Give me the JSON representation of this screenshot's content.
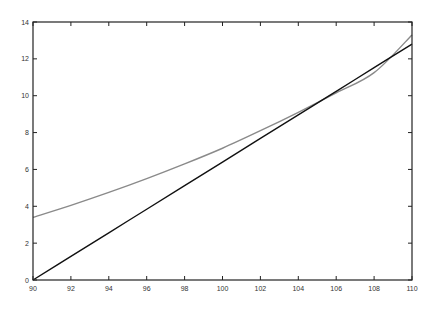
{
  "chart_data": {
    "type": "line",
    "title": "",
    "xlabel": "",
    "ylabel": "",
    "xlim": [
      90,
      110
    ],
    "ylim": [
      0,
      14
    ],
    "grid": false,
    "legend": null,
    "x_ticks": [
      90,
      92,
      94,
      96,
      98,
      100,
      102,
      104,
      106,
      108,
      110
    ],
    "y_ticks": [
      0,
      2,
      4,
      6,
      8,
      10,
      12,
      14
    ],
    "x": [
      90,
      92,
      94,
      96,
      98,
      100,
      102,
      104,
      106,
      108,
      110
    ],
    "series": [
      {
        "name": "gray curve",
        "color": "#8a8a8a",
        "values": [
          3.4,
          4.05,
          4.75,
          5.5,
          6.3,
          7.15,
          8.1,
          9.1,
          10.15,
          11.25,
          13.3
        ]
      },
      {
        "name": "black line",
        "color": "#111111",
        "values": [
          0.0,
          1.28,
          2.56,
          3.84,
          5.12,
          6.4,
          7.68,
          8.96,
          10.24,
          11.52,
          12.8
        ]
      }
    ]
  },
  "plot_area": {
    "left": 33,
    "top": 22,
    "right": 412,
    "bottom": 280
  }
}
